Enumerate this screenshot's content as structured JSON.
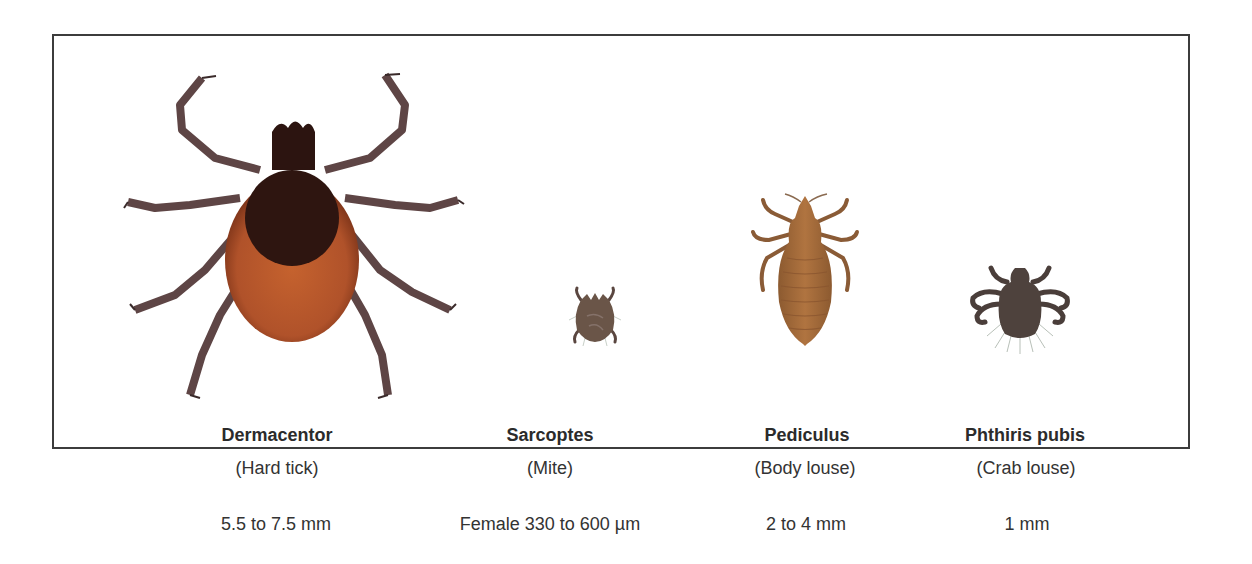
{
  "figure": {
    "specimens": [
      {
        "id": "dermacentor",
        "name": "Dermacentor",
        "common_name": "(Hard tick)",
        "size": "5.5 to 7.5 mm",
        "icon": "tick-illustration",
        "colors": {
          "body": "#b5572a",
          "shield": "#2e1510",
          "legs": "#6b5050"
        }
      },
      {
        "id": "sarcoptes",
        "name": "Sarcoptes",
        "common_name": "(Mite)",
        "size": "Female 330 to 600 µm",
        "icon": "mite-illustration",
        "colors": {
          "body": "#6a5548"
        }
      },
      {
        "id": "pediculus",
        "name": "Pediculus",
        "common_name": "(Body louse)",
        "size": "2 to 4 mm",
        "icon": "body-louse-illustration",
        "colors": {
          "body": "#a5693a"
        }
      },
      {
        "id": "phthiris",
        "name": "Phthiris pubis",
        "common_name": "(Crab louse)",
        "size": "1 mm",
        "icon": "crab-louse-illustration",
        "colors": {
          "body": "#4e423d"
        }
      }
    ]
  }
}
